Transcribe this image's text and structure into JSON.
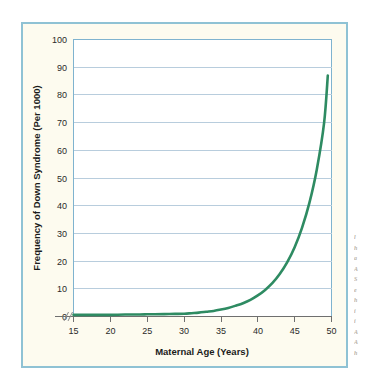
{
  "figure": {
    "frame_border_color": "#8fc2d4",
    "frame_background_color": "#fdfbef",
    "plot_background_color": "#ffffff"
  },
  "chart_data": {
    "type": "line",
    "title": "",
    "xlabel": "Maternal Age (Years)",
    "ylabel": "Frequency of Down Syndrome (Per 1000)",
    "xlim": [
      13,
      50
    ],
    "ylim": [
      0,
      100
    ],
    "xticks": [
      15,
      20,
      25,
      30,
      35,
      40,
      45,
      50
    ],
    "xtick_labels": [
      "15",
      "20",
      "25",
      "30",
      "35",
      "40",
      "45",
      "50"
    ],
    "yticks": [
      0,
      10,
      20,
      30,
      40,
      50,
      60,
      70,
      80,
      90,
      100
    ],
    "ytick_labels": [
      "0",
      "10",
      "20",
      "30",
      "40",
      "50",
      "60",
      "70",
      "80",
      "90",
      "100"
    ],
    "grid": "horizontal",
    "legend": "none",
    "axis_break": "x-axis break between 13 and 15",
    "series": [
      {
        "name": "Frequency of Down Syndrome",
        "color": "#2e8b62",
        "x": [
          15,
          18,
          20,
          22,
          24,
          25,
          26,
          28,
          30,
          31,
          32,
          33,
          34,
          35,
          36,
          37,
          38,
          39,
          40,
          41,
          42,
          43,
          44,
          45,
          46,
          47,
          48,
          49,
          49.5
        ],
        "y": [
          0.6,
          0.6,
          0.6,
          0.7,
          0.7,
          0.8,
          0.8,
          0.9,
          1.0,
          1.2,
          1.4,
          1.7,
          2.0,
          2.5,
          3.1,
          3.9,
          4.8,
          6.0,
          7.6,
          9.6,
          12.1,
          15.4,
          19.6,
          25.0,
          32.0,
          41.0,
          53.0,
          70.0,
          87.0
        ]
      }
    ]
  },
  "margin_note": {
    "text": "",
    "visible_fragment": "illegible-cut-off-text"
  }
}
